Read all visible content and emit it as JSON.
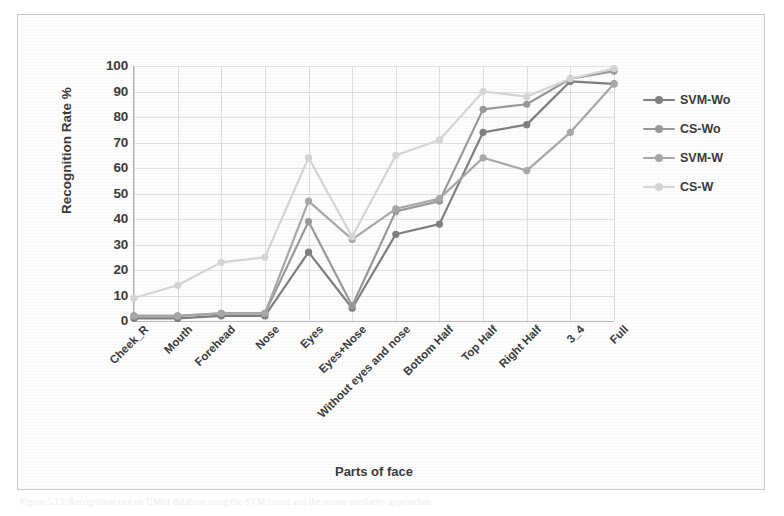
{
  "figure": {
    "caption": "Figure 5.13: Recognition rate on UMist database using the SVM-based and the cosine similarity approaches"
  },
  "legend": {
    "position": "right",
    "entries": [
      {
        "label": "SVM-Wo",
        "color": "#808080",
        "marker": "circle"
      },
      {
        "label": "CS-Wo",
        "color": "#9a9a9a",
        "marker": "circle"
      },
      {
        "label": "SVM-W",
        "color": "#a9a9a9",
        "marker": "circle"
      },
      {
        "label": "CS-W",
        "color": "#d6d6d6",
        "marker": "circle"
      }
    ]
  },
  "axes": {
    "y_title": "Recognition Rate %",
    "x_title": "Parts of face",
    "y_ticks": [
      0,
      10,
      20,
      30,
      40,
      50,
      60,
      70,
      80,
      90,
      100
    ],
    "y_min": 0,
    "y_max": 100,
    "grid": true
  },
  "chart_data": {
    "type": "line",
    "title": "",
    "xlabel": "Parts of face",
    "ylabel": "Recognition Rate %",
    "ylim": [
      0,
      100
    ],
    "grid": true,
    "legend_position": "right",
    "categories": [
      "Cheek_R",
      "Mouth",
      "Forehead",
      "Nose",
      "Eyes",
      "Eyes+Nose",
      "Without eyes and nose",
      "Bottom Half",
      "Top Half",
      "Right Half",
      "3_4",
      "Full"
    ],
    "series": [
      {
        "name": "SVM-Wo",
        "color": "#808080",
        "values": [
          1,
          1,
          2,
          2,
          27,
          5,
          34,
          38,
          74,
          77,
          94,
          93
        ]
      },
      {
        "name": "CS-Wo",
        "color": "#9a9a9a",
        "values": [
          2,
          2,
          3,
          3,
          39,
          6,
          43,
          47,
          83,
          85,
          95,
          98
        ]
      },
      {
        "name": "SVM-W",
        "color": "#a9a9a9",
        "values": [
          2,
          2,
          3,
          3,
          47,
          32,
          44,
          48,
          64,
          59,
          74,
          93
        ]
      },
      {
        "name": "CS-W",
        "color": "#d6d6d6",
        "values": [
          9,
          14,
          23,
          25,
          64,
          33,
          65,
          71,
          90,
          88,
          95,
          99
        ]
      }
    ]
  }
}
